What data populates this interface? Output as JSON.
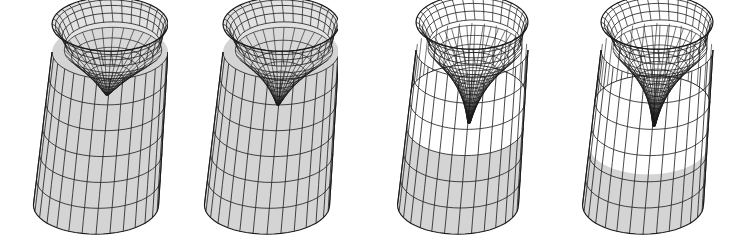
{
  "figure": {
    "background": "#ffffff",
    "line_color": "#1a1a1a",
    "fill_color": "#d4d4d4",
    "panels": [
      {
        "id": "panel-1",
        "cx": 96,
        "width": 130,
        "rimY": 52,
        "baseY": 205,
        "rx": 58,
        "ry": 30,
        "funnelDepth": 45,
        "funnelWidth": 0.75,
        "fillTop": 0.0,
        "stage": "shallow cup"
      },
      {
        "id": "panel-2",
        "cx": 267,
        "width": 130,
        "rimY": 52,
        "baseY": 205,
        "rx": 58,
        "ry": 30,
        "funnelDepth": 55,
        "funnelWidth": 0.55,
        "fillTop": 0.0,
        "stage": "narrowing cup"
      },
      {
        "id": "panel-3",
        "cx": 458,
        "width": 125,
        "rimY": 50,
        "baseY": 205,
        "rx": 56,
        "ry": 30,
        "funnelDepth": 75,
        "funnelWidth": 0.35,
        "fillTop": 0.5,
        "stage": "deep funnel"
      },
      {
        "id": "panel-4",
        "cx": 643,
        "width": 125,
        "rimY": 50,
        "baseY": 205,
        "rx": 56,
        "ry": 30,
        "funnelDepth": 78,
        "funnelWidth": 0.3,
        "fillTop": 0.62,
        "stage": "deepest funnel"
      }
    ]
  }
}
